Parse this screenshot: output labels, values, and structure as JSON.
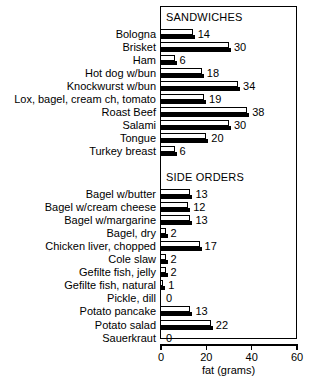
{
  "chart_data": {
    "type": "bar",
    "orientation": "horizontal",
    "title": "",
    "xlabel": "fat (grams)",
    "ylabel": "",
    "xlim": [
      0,
      60
    ],
    "xticks": [
      0,
      20,
      40,
      60
    ],
    "xtick_labels": [
      "0",
      "20",
      "40",
      "60"
    ],
    "grid": false,
    "legend": null,
    "value_labels": true,
    "groups": [
      {
        "name": "SANDWICHES",
        "categories": [
          "Bologna",
          "Brisket",
          "Ham",
          "Hot dog w/bun",
          "Knockwurst w/bun",
          "Lox, bagel, cream ch, tomato",
          "Roast Beef",
          "Salami",
          "Tongue",
          "Turkey breast"
        ],
        "values": [
          14,
          30,
          6,
          18,
          34,
          19,
          38,
          30,
          20,
          6
        ]
      },
      {
        "name": "SIDE ORDERS",
        "categories": [
          "Bagel w/butter",
          "Bagel w/cream cheese",
          "Bagel w/margarine",
          "Bagel, dry",
          "Chicken liver, chopped",
          "Cole slaw",
          "Gefilte fish, jelly",
          "Gefilte fish, natural",
          "Pickle, dill",
          "Potato pancake",
          "Potato salad",
          "Sauerkraut"
        ],
        "values": [
          13,
          12,
          13,
          2,
          17,
          2,
          2,
          1,
          0,
          13,
          22,
          0
        ]
      }
    ],
    "categories": [
      "Bologna",
      "Brisket",
      "Ham",
      "Hot dog w/bun",
      "Knockwurst w/bun",
      "Lox, bagel, cream ch, tomato",
      "Roast Beef",
      "Salami",
      "Tongue",
      "Turkey breast",
      "Bagel w/butter",
      "Bagel w/cream cheese",
      "Bagel w/margarine",
      "Bagel, dry",
      "Chicken liver, chopped",
      "Cole slaw",
      "Gefilte fish, jelly",
      "Gefilte fish, natural",
      "Pickle, dill",
      "Potato pancake",
      "Potato salad",
      "Sauerkraut"
    ],
    "values": [
      14,
      30,
      6,
      18,
      34,
      19,
      38,
      30,
      20,
      6,
      13,
      12,
      13,
      2,
      17,
      2,
      2,
      1,
      0,
      13,
      22,
      0
    ]
  },
  "colors": {
    "bar_face": "#ffffff",
    "bar_shadow": "#000000",
    "axis": "#000000",
    "text": "#000000",
    "background": "#ffffff"
  },
  "headers": {
    "sandwiches": "SANDWICHES",
    "side_orders": "SIDE ORDERS"
  },
  "axis": {
    "title": "fat (grams)",
    "ticks": [
      "0",
      "20",
      "40",
      "60"
    ]
  }
}
